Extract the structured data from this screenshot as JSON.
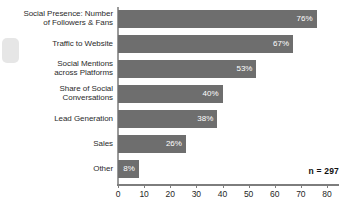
{
  "chart_data": {
    "type": "bar",
    "orientation": "horizontal",
    "title": "",
    "subtitle": "",
    "xlabel": "",
    "ylabel": "",
    "xlim": [
      0,
      80
    ],
    "xticks": [
      0,
      10,
      20,
      30,
      40,
      50,
      60,
      70,
      80
    ],
    "xtick_labels": [
      "0",
      "10",
      "20",
      "30",
      "40",
      "50",
      "60",
      "70",
      "80"
    ],
    "grid": false,
    "legend": null,
    "bar_color": "#6e6e6e",
    "value_label_color": "#ffffff",
    "categories": [
      "Social Presence: Number of Followers & Fans",
      "Traffic to Website",
      "Social Mentions across Platforms",
      "Share of Social Conversations",
      "Lead Generation",
      "Sales",
      "Other"
    ],
    "values": [
      76,
      67,
      53,
      40,
      38,
      26,
      8
    ],
    "value_labels": [
      "76%",
      "67%",
      "53%",
      "40%",
      "38%",
      "26%",
      "8%"
    ],
    "annotations": [
      {
        "name": "sample-size",
        "text": "n = 297"
      }
    ]
  },
  "rows": [
    {
      "label_line1": "Social Presence: Number",
      "label_line2": "of Followers & Fans",
      "value": 76,
      "value_label": "76%"
    },
    {
      "label_line1": "Traffic to Website",
      "label_line2": "",
      "value": 67,
      "value_label": "67%"
    },
    {
      "label_line1": "Social Mentions",
      "label_line2": "across Platforms",
      "value": 53,
      "value_label": "53%"
    },
    {
      "label_line1": "Share of Social",
      "label_line2": "Conversations",
      "value": 40,
      "value_label": "40%"
    },
    {
      "label_line1": "Lead Generation",
      "label_line2": "",
      "value": 38,
      "value_label": "38%"
    },
    {
      "label_line1": "Sales",
      "label_line2": "",
      "value": 26,
      "value_label": "26%"
    },
    {
      "label_line1": "Other",
      "label_line2": "",
      "value": 8,
      "value_label": "8%"
    }
  ],
  "axis": {
    "ticks": [
      "0",
      "10",
      "20",
      "30",
      "40",
      "50",
      "60",
      "70",
      "80"
    ]
  },
  "note": {
    "sample_size": "n = 297"
  }
}
